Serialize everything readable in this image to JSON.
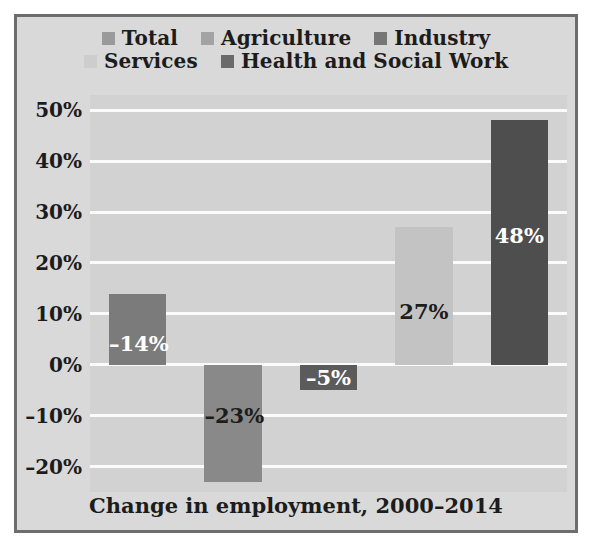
{
  "figure": {
    "background": "#d9d9d9",
    "border_color": "#6d6d6d",
    "plot_background": "#d2d2d2",
    "gridline_color": "#fbfbfb",
    "caption": "Change in employment, 2000–2014"
  },
  "legend": {
    "lines": [
      [
        {
          "label": "Total",
          "color": "#9a9a9a"
        },
        {
          "label": "Agriculture",
          "color": "#a3a3a3"
        },
        {
          "label": "Industry",
          "color": "#767676"
        }
      ],
      [
        {
          "label": "Services",
          "color": "#cdcdcd"
        },
        {
          "label": "Health and Social Work",
          "color": "#6a6a6a"
        }
      ]
    ]
  },
  "chart_data": {
    "type": "bar",
    "title": "",
    "subtitle": "",
    "xlabel": "",
    "ylabel": "",
    "caption": "Change in employment, 2000–2014",
    "categories": [
      "Total",
      "Agriculture",
      "Industry",
      "Services",
      "Health and Social Work"
    ],
    "values": [
      -14,
      -23,
      -5,
      27,
      48
    ],
    "value_labels": [
      "–14%",
      "–23%",
      "–5%",
      "27%",
      "48%"
    ],
    "bar_colors": [
      "#7b7b7b",
      "#898989",
      "#5b5b5b",
      "#c3c3c3",
      "#4e4e4e"
    ],
    "label_colors": [
      "#ffffff",
      "#1c1c1c",
      "#ffffff",
      "#1c1c1c",
      "#ffffff"
    ],
    "bar_directions": [
      "up",
      "down",
      "down",
      "up",
      "up"
    ],
    "ylim": [
      -25,
      53
    ],
    "yticks": [
      50,
      40,
      30,
      20,
      10,
      0,
      -10,
      -20
    ],
    "ytick_labels": [
      "50%",
      "40%",
      "30%",
      "20%",
      "10%",
      "0%",
      "–10%",
      "–20%"
    ],
    "grid": true,
    "legend_position": "top"
  }
}
